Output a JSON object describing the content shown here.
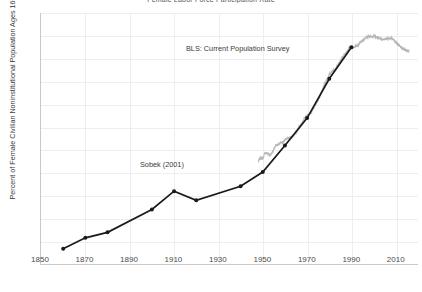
{
  "chart_data": {
    "type": "line",
    "title": "Female Labor Force Participation Rate",
    "xlabel": "",
    "ylabel": "Percent of Female Civilian Noninstitutional Population Ages 16+",
    "xlim": [
      1850,
      2020
    ],
    "ylim": [
      10,
      65
    ],
    "xticks": [
      1850,
      1870,
      1890,
      1910,
      1930,
      1950,
      1970,
      1990,
      2010
    ],
    "yticks": [
      10,
      15,
      20,
      25,
      30,
      35,
      40,
      45,
      50,
      55,
      60,
      65
    ],
    "grid": true,
    "legend_position": "inline-annotations",
    "annotations": [
      {
        "text": "BLS: Current Population Survey",
        "x": 1962,
        "y": 56.5
      },
      {
        "text": "Sobek (2001)",
        "x": 1927,
        "y": 31.5
      }
    ],
    "series": [
      {
        "name": "Sobek (2001)",
        "color": "#1a1a1a",
        "style": "line-with-markers",
        "points": [
          {
            "x": 1860,
            "y": 13.4
          },
          {
            "x": 1870,
            "y": 15.8
          },
          {
            "x": 1880,
            "y": 17.0
          },
          {
            "x": 1900,
            "y": 22.0
          },
          {
            "x": 1910,
            "y": 26.0
          },
          {
            "x": 1920,
            "y": 24.0
          },
          {
            "x": 1940,
            "y": 27.1
          },
          {
            "x": 1950,
            "y": 30.2
          },
          {
            "x": 1960,
            "y": 36.0
          },
          {
            "x": 1970,
            "y": 42.0
          },
          {
            "x": 1980,
            "y": 50.6
          },
          {
            "x": 1990,
            "y": 57.5
          }
        ]
      },
      {
        "name": "BLS: Current Population Survey",
        "color": "#b7b7b7",
        "style": "jagged-monthly-line",
        "points": [
          {
            "x": 1948,
            "y": 32.6
          },
          {
            "x": 1949,
            "y": 33.3
          },
          {
            "x": 1950,
            "y": 33.1
          },
          {
            "x": 1951,
            "y": 34.4
          },
          {
            "x": 1952,
            "y": 34.3
          },
          {
            "x": 1953,
            "y": 34.0
          },
          {
            "x": 1954,
            "y": 34.2
          },
          {
            "x": 1955,
            "y": 35.2
          },
          {
            "x": 1956,
            "y": 36.1
          },
          {
            "x": 1957,
            "y": 36.2
          },
          {
            "x": 1958,
            "y": 36.5
          },
          {
            "x": 1959,
            "y": 36.7
          },
          {
            "x": 1960,
            "y": 37.2
          },
          {
            "x": 1961,
            "y": 37.6
          },
          {
            "x": 1962,
            "y": 37.6
          },
          {
            "x": 1963,
            "y": 37.9
          },
          {
            "x": 1964,
            "y": 38.3
          },
          {
            "x": 1965,
            "y": 38.9
          },
          {
            "x": 1966,
            "y": 39.7
          },
          {
            "x": 1967,
            "y": 40.4
          },
          {
            "x": 1968,
            "y": 41.1
          },
          {
            "x": 1969,
            "y": 42.0
          },
          {
            "x": 1970,
            "y": 42.6
          },
          {
            "x": 1971,
            "y": 42.8
          },
          {
            "x": 1972,
            "y": 43.4
          },
          {
            "x": 1973,
            "y": 44.2
          },
          {
            "x": 1974,
            "y": 45.3
          },
          {
            "x": 1975,
            "y": 46.0
          },
          {
            "x": 1976,
            "y": 47.0
          },
          {
            "x": 1977,
            "y": 48.1
          },
          {
            "x": 1978,
            "y": 49.6
          },
          {
            "x": 1979,
            "y": 50.6
          },
          {
            "x": 1980,
            "y": 51.5
          },
          {
            "x": 1981,
            "y": 52.1
          },
          {
            "x": 1982,
            "y": 52.6
          },
          {
            "x": 1983,
            "y": 52.9
          },
          {
            "x": 1984,
            "y": 53.6
          },
          {
            "x": 1985,
            "y": 54.5
          },
          {
            "x": 1986,
            "y": 55.3
          },
          {
            "x": 1987,
            "y": 56.0
          },
          {
            "x": 1988,
            "y": 56.6
          },
          {
            "x": 1989,
            "y": 57.4
          },
          {
            "x": 1990,
            "y": 57.5
          },
          {
            "x": 1991,
            "y": 57.4
          },
          {
            "x": 1992,
            "y": 57.8
          },
          {
            "x": 1993,
            "y": 57.9
          },
          {
            "x": 1994,
            "y": 58.8
          },
          {
            "x": 1995,
            "y": 58.9
          },
          {
            "x": 1996,
            "y": 59.3
          },
          {
            "x": 1997,
            "y": 59.8
          },
          {
            "x": 1998,
            "y": 59.8
          },
          {
            "x": 1999,
            "y": 60.0
          },
          {
            "x": 2000,
            "y": 59.9
          },
          {
            "x": 2001,
            "y": 59.8
          },
          {
            "x": 2002,
            "y": 59.6
          },
          {
            "x": 2003,
            "y": 59.5
          },
          {
            "x": 2004,
            "y": 59.2
          },
          {
            "x": 2005,
            "y": 59.3
          },
          {
            "x": 2006,
            "y": 59.4
          },
          {
            "x": 2007,
            "y": 59.3
          },
          {
            "x": 2008,
            "y": 59.5
          },
          {
            "x": 2009,
            "y": 59.2
          },
          {
            "x": 2010,
            "y": 58.6
          },
          {
            "x": 2011,
            "y": 58.1
          },
          {
            "x": 2012,
            "y": 57.7
          },
          {
            "x": 2013,
            "y": 57.2
          },
          {
            "x": 2014,
            "y": 57.0
          },
          {
            "x": 2015,
            "y": 56.7
          },
          {
            "x": 2016,
            "y": 56.8
          }
        ]
      }
    ]
  }
}
